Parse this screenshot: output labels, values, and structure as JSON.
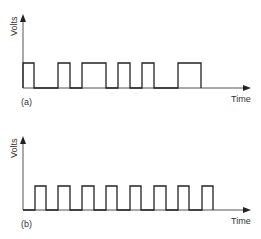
{
  "panels": [
    {
      "id": "a",
      "label": "(a)",
      "ylabel": "Volts",
      "xlabel": "Time",
      "description": "Irregular pulse train (varying pulse widths and spacing)",
      "pulses": [
        [
          23,
          34
        ],
        [
          58,
          70
        ],
        [
          82,
          106
        ],
        [
          118,
          130
        ],
        [
          142,
          154
        ],
        [
          178,
          201
        ]
      ]
    },
    {
      "id": "b",
      "label": "(b)",
      "ylabel": "Volts",
      "xlabel": "Time",
      "description": "Regular periodic pulse train (equal width and spacing)",
      "pulses": [
        [
          35,
          46
        ],
        [
          58,
          70
        ],
        [
          82,
          94
        ],
        [
          106,
          117
        ],
        [
          130,
          141
        ],
        [
          154,
          166
        ],
        [
          178,
          189
        ],
        [
          202,
          213
        ]
      ]
    }
  ],
  "colors": {
    "stroke": "#222222",
    "axis": "#555555",
    "text": "#333333"
  }
}
